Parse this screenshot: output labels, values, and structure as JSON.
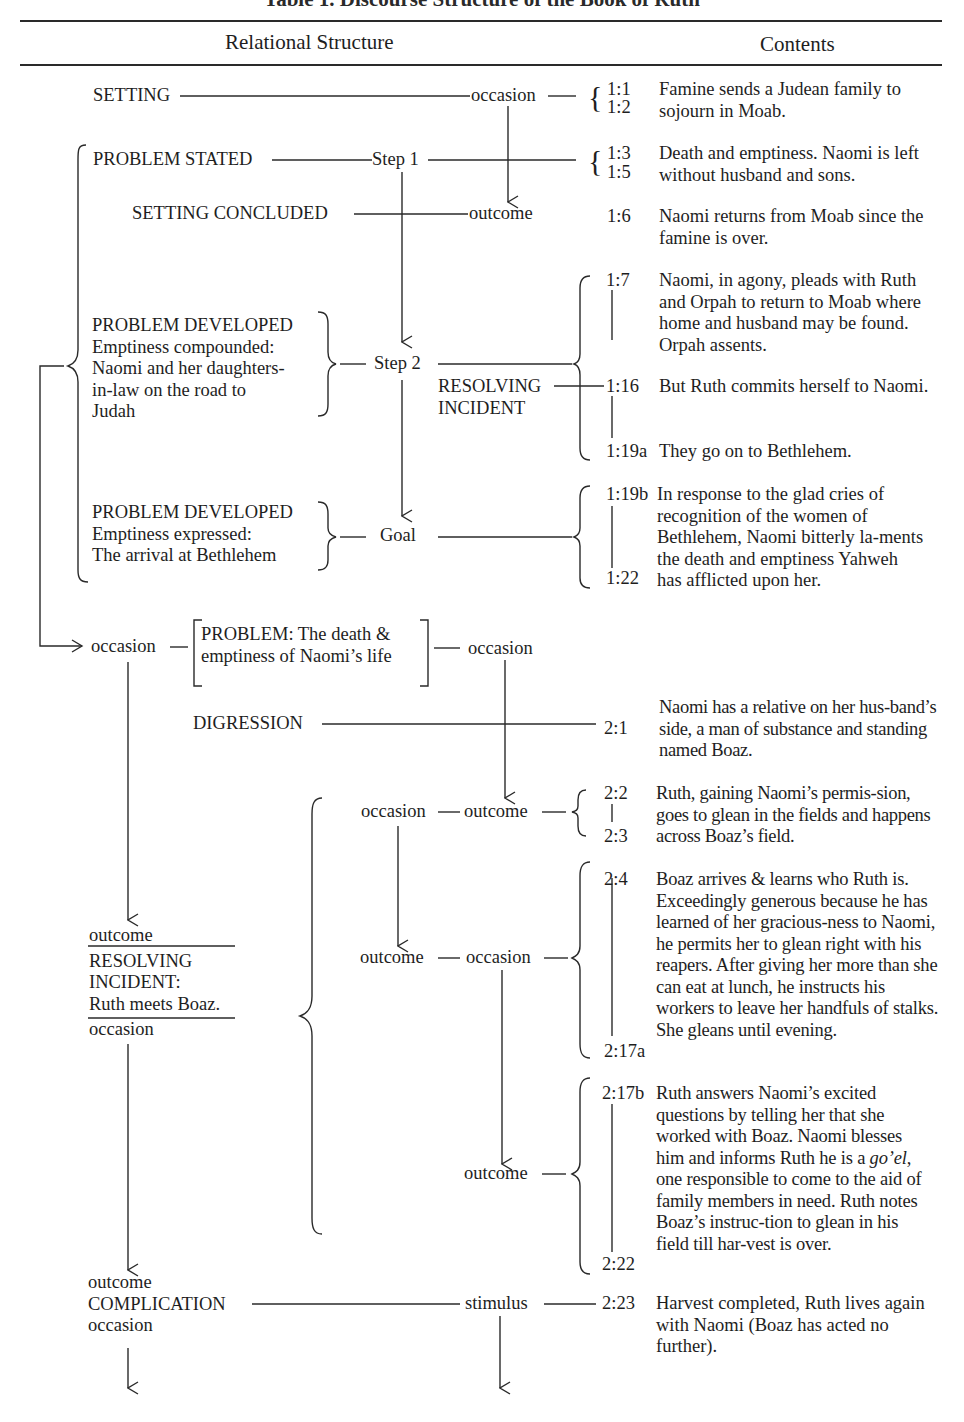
{
  "caption": "Table 1. Discourse Structure of the Book of Ruth",
  "header": {
    "left": "Relational Structure",
    "right": "Contents"
  },
  "structure": {
    "setting": "SETTING",
    "setting_rel": "occasion",
    "problem_stated": "PROBLEM STATED",
    "step1": "Step 1",
    "setting_concluded": "SETTING CONCLUDED",
    "setting_concluded_rel": "outcome",
    "problem_developed_1": {
      "title": "PROBLEM DEVELOPED",
      "lines": [
        "Emptiness compounded:",
        "Naomi and her daughters-",
        "in-law on the road to",
        "Judah"
      ]
    },
    "step2": "Step 2",
    "resolving_incident_1": [
      "RESOLVING",
      "INCIDENT"
    ],
    "problem_developed_2": {
      "title": "PROBLEM DEVELOPED",
      "lines": [
        "Emptiness expressed:",
        "The arrival at Bethlehem"
      ]
    },
    "goal": "Goal",
    "problem_box": {
      "left_rel": "occasion",
      "lines": [
        "PROBLEM: The  death &",
        "emptiness of Naomi’s life"
      ],
      "right_rel": "occasion"
    },
    "digression": "DIGRESSION",
    "ch2_row1": {
      "left": "occasion",
      "right": "outcome"
    },
    "ch2_row2": {
      "left": "outcome",
      "right": "occasion"
    },
    "ch2_row3": {
      "right": "outcome"
    },
    "resolving_incident_2": {
      "top": "outcome",
      "lines": [
        "RESOLVING",
        "INCIDENT:",
        "Ruth meets Boaz."
      ],
      "bottom": "occasion"
    },
    "complication": {
      "top": "outcome",
      "title": "COMPLICATION",
      "bottom": "occasion",
      "rel": "stimulus"
    }
  },
  "contents": [
    {
      "refs": [
        "1:1",
        "1:2"
      ],
      "text": "Famine sends a Judean family to sojourn in Moab."
    },
    {
      "refs": [
        "1:3",
        "1:5"
      ],
      "text": "Death and emptiness. Naomi is left without husband and sons."
    },
    {
      "refs": [
        "1:6"
      ],
      "text": "Naomi returns from Moab since the famine is over."
    },
    {
      "refs": [
        "1:7"
      ],
      "text": "Naomi, in agony, pleads with Ruth and Orpah to return to Moab where home and husband may be found. Orpah assents."
    },
    {
      "refs": [
        "1:16"
      ],
      "text": "But Ruth commits herself to Naomi."
    },
    {
      "refs": [
        "1:19a"
      ],
      "text": "They go on to Bethlehem."
    },
    {
      "refs": [
        "1:19b",
        "1:22"
      ],
      "text": "In response to the glad cries of recognition of the women of Bethlehem, Naomi bitterly la-ments the death and emptiness Yahweh has afflicted upon her."
    },
    {
      "refs": [
        "2:1"
      ],
      "text": "Naomi has a relative on her hus-band’s side, a man of substance and standing named Boaz."
    },
    {
      "refs": [
        "2:2",
        "2:3"
      ],
      "text": "Ruth, gaining Naomi’s permis-sion, goes to glean in the fields and happens across Boaz’s field."
    },
    {
      "refs": [
        "2:4",
        "2:17a"
      ],
      "text": "Boaz arrives & learns who Ruth is. Exceedingly generous because he has learned of her gracious-ness to Naomi, he permits her to glean right with his reapers. After giving her more than she can eat at lunch, he instructs his workers to leave her handfuls of stalks. She gleans until evening."
    },
    {
      "refs": [
        "2:17b",
        "2:22"
      ],
      "text_pre": "Ruth answers Naomi’s excited questions by telling her that she worked with Boaz. Naomi blesses him and informs Ruth he is a ",
      "term": "goʼel",
      "text_post": ", one responsible to come to the aid of family members in need. Ruth notes Boaz’s instruc-tion to glean in his field till har-vest is over."
    },
    {
      "refs": [
        "2:23"
      ],
      "text": "Harvest completed, Ruth lives again with Naomi (Boaz has acted no further)."
    }
  ]
}
